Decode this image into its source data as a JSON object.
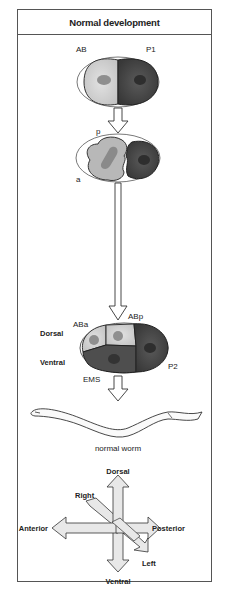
{
  "header": {
    "title": "Normal development"
  },
  "stage1": {
    "cell_left": "AB",
    "cell_right": "P1"
  },
  "stage2": {
    "label_p": "p",
    "label_a": "a"
  },
  "stage3": {
    "cell_aba": "ABa",
    "cell_abp": "ABp",
    "cell_ems": "EMS",
    "cell_p2": "P2",
    "side_dorsal": "Dorsal",
    "side_ventral": "Ventral"
  },
  "worm": {
    "caption": "normal worm"
  },
  "axes": {
    "dorsal": "Dorsal",
    "ventral": "Ventral",
    "anterior": "Anterior",
    "posterior": "Posterior",
    "right": "Right",
    "left": "Left"
  },
  "colors": {
    "light_cell": "#d6d6d6",
    "mid_cell": "#a8a8a8",
    "dark_cell": "#4a4a4a",
    "nucleus_light": "#8f8f8f",
    "nucleus_dark": "#2e2e2e",
    "outline": "#333333"
  }
}
